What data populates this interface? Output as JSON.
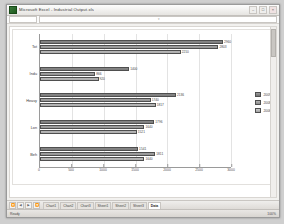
{
  "window": {
    "title": "Microsoft Excel - Industrial Output.xls",
    "icon": "excel-icon",
    "buttons": {
      "minimize": "–",
      "maximize": "□",
      "close": "×"
    }
  },
  "formula_bar": {
    "name_box": "",
    "value": "",
    "fx": "fx"
  },
  "chart_data": {
    "type": "bar",
    "orientation": "horizontal",
    "title": "",
    "xlabel": "",
    "ylabel": "",
    "xlim": [
      0,
      3000
    ],
    "grid": true,
    "legend_position": "right",
    "categories": [
      "Tot",
      "Indu",
      "Heavy",
      "Lon",
      "Beh"
    ],
    "xticks": [
      "0",
      "500",
      "1000",
      "1500",
      "2000",
      "2500",
      "3000"
    ],
    "series": [
      {
        "name": "2009",
        "values": [
          2960,
          1400,
          2136,
          1796,
          1541
        ]
      },
      {
        "name": "2008",
        "values": [
          2803,
          866,
          1740,
          1640,
          1811
        ]
      },
      {
        "name": "2006",
        "values": [
          2210,
          920,
          1817,
          1521,
          1640
        ]
      }
    ]
  },
  "sheet_tabs": {
    "nav": {
      "first": "⏪",
      "prev": "◀",
      "next": "▶",
      "last": "⏩"
    },
    "tabs": [
      {
        "label": "Chart1",
        "active": false
      },
      {
        "label": "Chart2",
        "active": false
      },
      {
        "label": "Chart3",
        "active": false
      },
      {
        "label": "Sheet1",
        "active": false
      },
      {
        "label": "Sheet2",
        "active": false
      },
      {
        "label": "Sheet3",
        "active": false
      },
      {
        "label": "Data",
        "active": true
      }
    ]
  },
  "status_bar": {
    "status": "Ready",
    "zoom": "100%"
  }
}
